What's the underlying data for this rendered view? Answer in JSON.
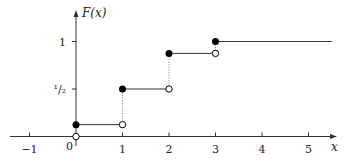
{
  "chart_data": {
    "type": "line",
    "subtype": "step-cdf",
    "title": "",
    "xlabel": "x",
    "ylabel": "F(x)",
    "xlim": [
      -1.4,
      5.6
    ],
    "ylim": [
      0,
      1.2
    ],
    "x_ticks": [
      -1,
      1,
      2,
      3,
      4,
      5
    ],
    "x_tick_labels": [
      "−1",
      "1",
      "2",
      "3",
      "4",
      "5"
    ],
    "origin_label": "0",
    "y_ticks": [
      0.5,
      1
    ],
    "y_tick_labels": [
      "¹/₂",
      "1"
    ],
    "grid": false,
    "legend": null,
    "steps": [
      {
        "x_start": 0,
        "x_end": 1,
        "value": 0.125
      },
      {
        "x_start": 1,
        "x_end": 2,
        "value": 0.5
      },
      {
        "x_start": 2,
        "x_end": 3,
        "value": 0.875
      },
      {
        "x_start": 3,
        "x_end": 5.5,
        "value": 1
      }
    ],
    "jumps": [
      {
        "x": 0,
        "from": 0,
        "to": 0.125
      },
      {
        "x": 1,
        "from": 0.125,
        "to": 0.5
      },
      {
        "x": 2,
        "from": 0.5,
        "to": 0.875
      },
      {
        "x": 3,
        "from": 0.875,
        "to": 1
      }
    ],
    "filled_points": [
      [
        0,
        0.125
      ],
      [
        1,
        0.5
      ],
      [
        2,
        0.875
      ],
      [
        3,
        1
      ]
    ],
    "open_points": [
      [
        0,
        0
      ],
      [
        1,
        0.125
      ],
      [
        2,
        0.5
      ],
      [
        3,
        0.875
      ]
    ]
  },
  "colors": {
    "axis": "#333333",
    "line": "#333333",
    "dotted": "#888888",
    "point": "#000000"
  }
}
